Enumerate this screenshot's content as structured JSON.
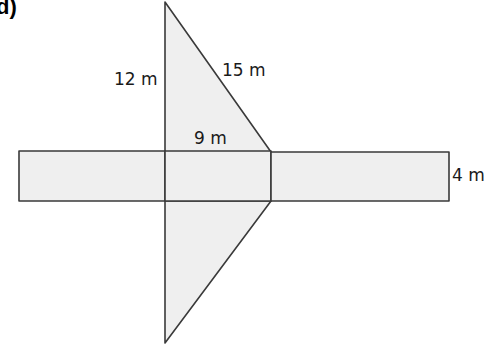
{
  "part_label": "d)",
  "labels": {
    "height": "12 m",
    "hypotenuse": "15 m",
    "base": "9 m",
    "width": "4 m"
  },
  "colors": {
    "fill": "#efefef",
    "stroke": "#3a3a3a"
  }
}
